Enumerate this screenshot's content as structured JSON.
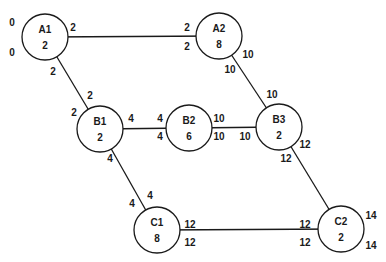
{
  "nodes": [
    {
      "id": "A1",
      "name": "A1",
      "value": "2",
      "cx": 45,
      "cy": 37
    },
    {
      "id": "A2",
      "name": "A2",
      "value": "8",
      "cx": 219,
      "cy": 36
    },
    {
      "id": "B1",
      "name": "B1",
      "value": "2",
      "cx": 100,
      "cy": 129
    },
    {
      "id": "B2",
      "name": "B2",
      "value": "6",
      "cx": 189,
      "cy": 128
    },
    {
      "id": "B3",
      "name": "B3",
      "value": "2",
      "cx": 279,
      "cy": 127
    },
    {
      "id": "C1",
      "name": "C1",
      "value": "8",
      "cx": 157,
      "cy": 230
    },
    {
      "id": "C2",
      "name": "C2",
      "value": "2",
      "cx": 341,
      "cy": 229
    }
  ],
  "edges": [
    {
      "from": "A1",
      "to": "A2"
    },
    {
      "from": "A1",
      "to": "B1"
    },
    {
      "from": "A2",
      "to": "B3"
    },
    {
      "from": "B1",
      "to": "B2"
    },
    {
      "from": "B2",
      "to": "B3"
    },
    {
      "from": "B1",
      "to": "C1"
    },
    {
      "from": "B3",
      "to": "C2"
    },
    {
      "from": "C1",
      "to": "C2"
    }
  ],
  "labels": [
    {
      "text": "0",
      "x": 12,
      "y": 26
    },
    {
      "text": "0",
      "x": 12,
      "y": 56
    },
    {
      "text": "2",
      "x": 73,
      "y": 31
    },
    {
      "text": "2",
      "x": 187,
      "y": 31
    },
    {
      "text": "2",
      "x": 187,
      "y": 50
    },
    {
      "text": "2",
      "x": 53,
      "y": 75
    },
    {
      "text": "2",
      "x": 90,
      "y": 99
    },
    {
      "text": "2",
      "x": 74,
      "y": 116
    },
    {
      "text": "10",
      "x": 248,
      "y": 58
    },
    {
      "text": "10",
      "x": 230,
      "y": 73
    },
    {
      "text": "10",
      "x": 272,
      "y": 98
    },
    {
      "text": "4",
      "x": 131,
      "y": 122
    },
    {
      "text": "4",
      "x": 160,
      "y": 122
    },
    {
      "text": "4",
      "x": 160,
      "y": 140
    },
    {
      "text": "10",
      "x": 219,
      "y": 122
    },
    {
      "text": "10",
      "x": 219,
      "y": 140
    },
    {
      "text": "10",
      "x": 245,
      "y": 140
    },
    {
      "text": "4",
      "x": 110,
      "y": 162
    },
    {
      "text": "12",
      "x": 305,
      "y": 148
    },
    {
      "text": "12",
      "x": 286,
      "y": 162
    },
    {
      "text": "4",
      "x": 150,
      "y": 199
    },
    {
      "text": "4",
      "x": 132,
      "y": 207
    },
    {
      "text": "12",
      "x": 190,
      "y": 228
    },
    {
      "text": "12",
      "x": 190,
      "y": 246
    },
    {
      "text": "12",
      "x": 305,
      "y": 228
    },
    {
      "text": "12",
      "x": 305,
      "y": 246
    },
    {
      "text": "14",
      "x": 371,
      "y": 219
    },
    {
      "text": "14",
      "x": 371,
      "y": 249
    }
  ],
  "style": {
    "stroke": "#1a1a1a",
    "radius": 23
  }
}
